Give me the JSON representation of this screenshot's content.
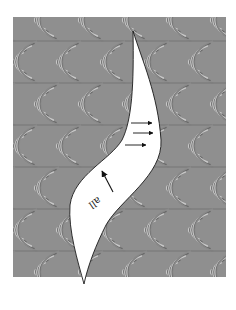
{
  "figure": {
    "colors": {
      "page_background": "#ffffff",
      "pattern_dark": "#5a5a5a",
      "pattern_mid": "#8c8c8c",
      "pattern_light": "#d2d2d2",
      "band_fill": "#ffffff",
      "band_outline": "#1a1a1a",
      "arrow_color": "#111111"
    },
    "frame": {
      "x": 13,
      "y": 17,
      "width": 213,
      "height": 260
    },
    "band_label": {
      "text": "all",
      "rotation_deg": 145
    },
    "arrows": [
      {
        "name": "arrow-right-1",
        "direction": "right",
        "x1": 131,
        "y1": 123,
        "x2": 152,
        "y2": 123
      },
      {
        "name": "arrow-right-2",
        "direction": "right",
        "x1": 133,
        "y1": 133,
        "x2": 153,
        "y2": 133
      },
      {
        "name": "arrow-right-3",
        "direction": "right",
        "x1": 125,
        "y1": 145,
        "x2": 146,
        "y2": 145
      },
      {
        "name": "arrow-up-left",
        "direction": "up-left",
        "x1": 113,
        "y1": 192,
        "x2": 102,
        "y2": 171
      }
    ]
  }
}
